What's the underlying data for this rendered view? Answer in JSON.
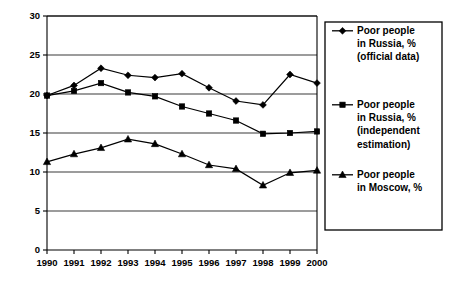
{
  "chart_data": {
    "type": "line",
    "title": "",
    "xlabel": "",
    "ylabel": "",
    "x": [
      1990,
      1991,
      1992,
      1993,
      1994,
      1995,
      1996,
      1997,
      1998,
      1999,
      2000
    ],
    "categories": [
      "1990",
      "1991",
      "1992",
      "1993",
      "1994",
      "1995",
      "1996",
      "1997",
      "1998",
      "1999",
      "2000"
    ],
    "xlim": [
      1990,
      2000
    ],
    "ylim": [
      0,
      30
    ],
    "yticks": [
      0,
      5,
      10,
      15,
      20,
      25,
      30
    ],
    "ytick_labels": [
      "0",
      "5",
      "10",
      "15",
      "20",
      "25",
      "30"
    ],
    "grid": true,
    "grid_axis": "y",
    "legend_position": "right",
    "series": [
      {
        "name": "Poor people in Russia, % (official data)",
        "marker": "diamond",
        "values": [
          19.8,
          21.1,
          23.3,
          22.4,
          22.1,
          22.6,
          20.8,
          19.1,
          18.6,
          22.5,
          21.4
        ]
      },
      {
        "name": "Poor people in Russia, % (independent estimation)",
        "marker": "square",
        "values": [
          19.8,
          20.4,
          21.4,
          20.2,
          19.7,
          18.4,
          17.5,
          16.6,
          14.9,
          15.0,
          15.2
        ]
      },
      {
        "name": "Poor people in Moscow, %",
        "marker": "triangle",
        "values": [
          11.3,
          12.3,
          13.1,
          14.2,
          13.6,
          12.3,
          10.9,
          10.4,
          8.3,
          9.9,
          10.2
        ]
      }
    ]
  },
  "legend": {
    "entries": [
      {
        "marker": "diamond",
        "lines": [
          "Poor people",
          "in Russia, %",
          "(official data)"
        ]
      },
      {
        "marker": "square",
        "lines": [
          "Poor people",
          "in Russia, %",
          "(independent",
          "estimation)"
        ]
      },
      {
        "marker": "triangle",
        "lines": [
          "Poor people",
          "in Moscow, %"
        ]
      }
    ]
  },
  "colors": {
    "series": "#000000",
    "grid": "#3a3a3a",
    "axis": "#000000",
    "background": "#ffffff"
  }
}
